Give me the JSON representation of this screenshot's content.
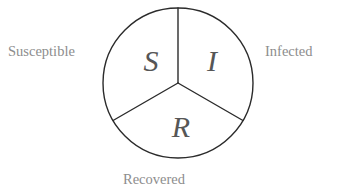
{
  "diagram": {
    "type": "circle-divided-into-three-sectors",
    "background_color": "#ffffff",
    "stroke_color": "#2b2b2b",
    "letter_color": "#565656",
    "label_color": "#8d8d8d",
    "circle": {
      "center_x": 178,
      "center_y": 83,
      "radius": 75,
      "stroke_width": 1.4
    },
    "sectors": [
      {
        "key": "susceptible",
        "letter": "S",
        "label": "Susceptible",
        "label_position": "left",
        "angle_start_deg": 90,
        "angle_end_deg": 210
      },
      {
        "key": "infected",
        "letter": "I",
        "label": "Infected",
        "label_position": "right",
        "angle_start_deg": 330,
        "angle_end_deg": 90
      },
      {
        "key": "recovered",
        "letter": "R",
        "label": "Recovered",
        "label_position": "bottom",
        "angle_start_deg": 210,
        "angle_end_deg": 330
      }
    ],
    "dividers": [
      {
        "key": "divider-top",
        "from": "center",
        "to_angle_deg": 90
      },
      {
        "key": "divider-lower-left",
        "from": "center",
        "to_angle_deg": 210
      },
      {
        "key": "divider-lower-right",
        "from": "center",
        "to_angle_deg": 330
      }
    ]
  }
}
